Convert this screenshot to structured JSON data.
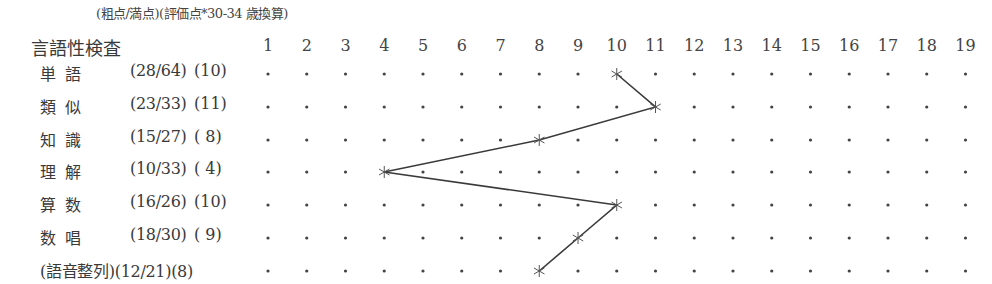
{
  "header": {
    "note": "(粗点/満点)(評価点*30-34 歳換算)",
    "section_title": "言語性検査"
  },
  "colors": {
    "text": "#3a3a3a",
    "line": "#3a3a3a",
    "dot": "#444444"
  },
  "columns": [
    "1",
    "2",
    "3",
    "4",
    "5",
    "6",
    "7",
    "8",
    "9",
    "10",
    "11",
    "12",
    "13",
    "14",
    "15",
    "16",
    "17",
    "18",
    "19"
  ],
  "rows": [
    {
      "name": "単語",
      "raw": "(28/64)",
      "scaled": "(10)"
    },
    {
      "name": "類似",
      "raw": "(23/33)",
      "scaled": "(11)"
    },
    {
      "name": "知識",
      "raw": "(15/27)",
      "scaled": "( 8)"
    },
    {
      "name": "理解",
      "raw": "(10/33)",
      "scaled": "( 4)"
    },
    {
      "name": "算数",
      "raw": "(16/26)",
      "scaled": "(10)"
    },
    {
      "name": "数唱",
      "raw": "(18/30)",
      "scaled": "( 9)"
    },
    {
      "name": "(語音整列)",
      "raw": "(12/21)",
      "scaled": "(8)",
      "full": "(語音整列)(12/21)(8)"
    }
  ],
  "chart_data": {
    "type": "line",
    "title": "言語性検査",
    "subtitle": "(粗点/満点)(評価点*30-34 歳換算)",
    "orientation": "horizontal-profile",
    "x_axis": {
      "label": "評価点",
      "ticks": [
        1,
        2,
        3,
        4,
        5,
        6,
        7,
        8,
        9,
        10,
        11,
        12,
        13,
        14,
        15,
        16,
        17,
        18,
        19
      ],
      "range": [
        1,
        19
      ]
    },
    "categories": [
      "単語",
      "類似",
      "知識",
      "理解",
      "算数",
      "数唱",
      "語音整列"
    ],
    "raw_scores": [
      "28/64",
      "23/33",
      "15/27",
      "10/33",
      "16/26",
      "18/30",
      "12/21"
    ],
    "series": [
      {
        "name": "評価点",
        "values": [
          10,
          11,
          8,
          4,
          10,
          9,
          8
        ],
        "marker": "asterisk"
      }
    ],
    "grid": "dotted points at each integer per row",
    "legend": "none"
  }
}
